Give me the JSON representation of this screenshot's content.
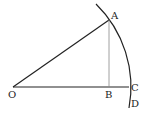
{
  "diagram": {
    "type": "geometry",
    "labels": {
      "O": "O",
      "A": "A",
      "B": "B",
      "C": "C",
      "D": "D"
    },
    "colors": {
      "stroke": "#222222",
      "thin_stroke": "#777777",
      "background": "#ffffff"
    }
  }
}
